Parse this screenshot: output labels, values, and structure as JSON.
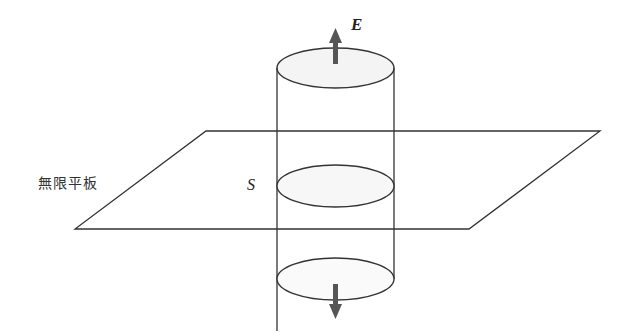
{
  "diagram": {
    "plate_label": "無限平板",
    "surface_label": "S",
    "field_label": "E",
    "colors": {
      "stroke": "#333333",
      "arrow": "#555555",
      "fill": "#f4f4f4"
    }
  }
}
